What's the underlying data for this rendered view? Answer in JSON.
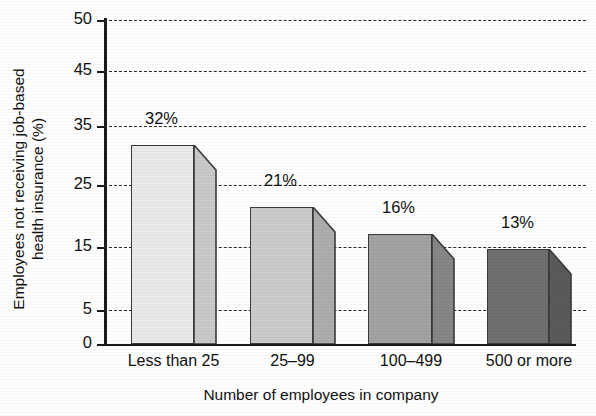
{
  "chart_data": {
    "type": "bar",
    "title": "",
    "subtitle": "",
    "xlabel": "Number of employees in company",
    "ylabel_line1": "Employees not receiving job-based",
    "ylabel_line2": "health insurance (%)",
    "ylabel": "Employees not receiving job-based health insurance (%)",
    "categories": [
      "Less than 25",
      "25–99",
      "100–499",
      "500 or more"
    ],
    "values": [
      32,
      21,
      16,
      13
    ],
    "data_labels": [
      "32%",
      "21%",
      "16%",
      "13%"
    ],
    "ytick_labels": [
      "50",
      "45",
      "35",
      "25",
      "15",
      "5",
      "0"
    ],
    "ytick_values": [
      50,
      45,
      35,
      25,
      15,
      5,
      0
    ],
    "ylim": [
      0,
      50
    ],
    "grid": "horizontal-dashed",
    "legend": "none",
    "bar_style": "3d-extruded",
    "bar_colors": [
      "#e9e9e7",
      "#cbcbc9",
      "#a2a2a0",
      "#6f6f6e"
    ],
    "bar_side_colors": [
      "#c9c9c7",
      "#adadab",
      "#868684",
      "#5a5a59"
    ],
    "bar_edge_color": "#3a3a3a",
    "axis_color": "#1b1b1b",
    "grid_color": "#2a2a2a",
    "background": "#ffffff",
    "series": [
      {
        "name": "Employees not receiving job-based health insurance",
        "values": [
          32,
          21,
          16,
          13
        ]
      }
    ],
    "points": [
      {
        "category": "Less than 25",
        "value": 32,
        "label": "32%"
      },
      {
        "category": "25–99",
        "value": 21,
        "label": "21%"
      },
      {
        "category": "100–499",
        "value": 16,
        "label": "16%"
      },
      {
        "category": "500 or more",
        "value": 13,
        "label": "13%"
      }
    ]
  },
  "geometry": {
    "ytick_y_px": [
      20,
      71,
      126,
      185,
      247,
      310,
      344
    ],
    "bar_top_y_px": [
      145,
      207,
      234,
      249
    ],
    "bar_front_x_px": [
      [
        131,
        194
      ],
      [
        250,
        313
      ],
      [
        368,
        432
      ],
      [
        487,
        549
      ]
    ],
    "bar_depth_px": 22,
    "baseline_y_px": 344
  }
}
